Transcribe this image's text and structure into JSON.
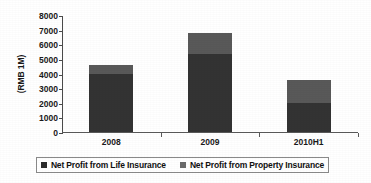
{
  "chart_data": {
    "type": "bar",
    "stacked": true,
    "title": "",
    "xlabel": "",
    "ylabel": "(RMB 1M)",
    "categories": [
      "2008",
      "2009",
      "2010H1"
    ],
    "series": [
      {
        "name": "Net Profit from Life Insurance",
        "color": "#333333",
        "values": [
          3950,
          5350,
          2000
        ]
      },
      {
        "name": "Net Profit from Property Insurance",
        "color": "#595959",
        "values": [
          600,
          1400,
          1570
        ]
      }
    ],
    "totals": [
      4550,
      6750,
      3570
    ],
    "ylim": [
      0,
      8000
    ],
    "ytick_step": 1000,
    "ytick_labels": [
      "8000",
      "7000",
      "6000",
      "5000",
      "4000",
      "3000",
      "2000",
      "1000",
      "0"
    ],
    "ytick_values": [
      8000,
      7000,
      6000,
      5000,
      4000,
      3000,
      2000,
      1000,
      0
    ],
    "grid": false,
    "legend_position": "bottom"
  },
  "legend": {
    "items": [
      {
        "label": "Net Profit from Life Insurance",
        "color": "#2b2b2b"
      },
      {
        "label": "Net Profit from Property Insurance",
        "color": "#6a6a6a"
      }
    ]
  },
  "axis": {
    "y_title": "(RMB 1M)"
  }
}
